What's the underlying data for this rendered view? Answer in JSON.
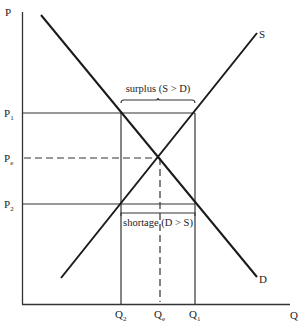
{
  "diagram": {
    "axes": {
      "y_label": "P",
      "x_label": "Q"
    },
    "price_levels": [
      {
        "id": "p1",
        "label": "P",
        "subscript": "1",
        "value": 0.81
      },
      {
        "id": "pe",
        "label": "P",
        "subscript": "e",
        "value": 0.5
      },
      {
        "id": "p2",
        "label": "P",
        "subscript": "2",
        "value": 0.19
      }
    ],
    "quantity_levels": [
      {
        "id": "q2",
        "label": "Q",
        "subscript": "2",
        "value": 0.37
      },
      {
        "id": "qe",
        "label": "Q",
        "subscript": "e",
        "value": 0.52
      },
      {
        "id": "q1",
        "label": "Q",
        "subscript": "1",
        "value": 0.65
      }
    ],
    "curves": {
      "supply": {
        "label": "S"
      },
      "demand": {
        "label": "D"
      }
    },
    "annotations": {
      "surplus": "surplus (S > D)",
      "shortage": "shortage (D > S)"
    }
  }
}
